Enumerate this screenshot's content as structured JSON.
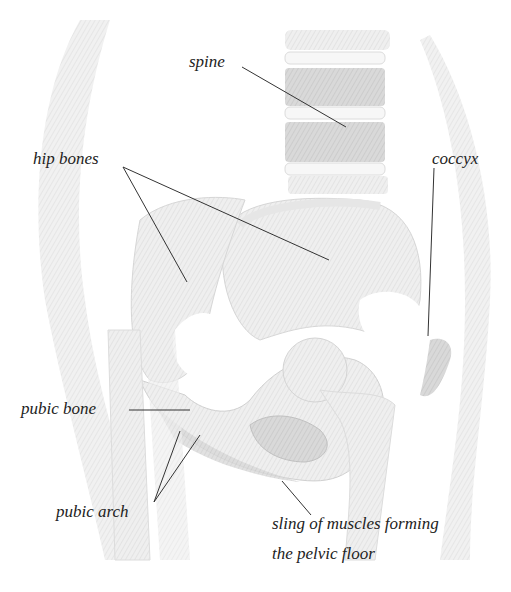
{
  "diagram": {
    "labels": {
      "spine": "spine",
      "hip_bones": "hip bones",
      "coccyx": "coccyx",
      "pubic_bone": "pubic bone",
      "pubic_arch": "pubic arch",
      "pelvic_floor_line1": "sling of muscles forming",
      "pelvic_floor_line2": "the pelvic floor"
    },
    "colors": {
      "bone_fill": "#ececec",
      "bone_shade": "#d8d8d8",
      "muscle_fill": "#cfcfcf",
      "body_outline": "#e4e4e4",
      "leader_line": "#333333",
      "label_text": "#222222"
    }
  }
}
